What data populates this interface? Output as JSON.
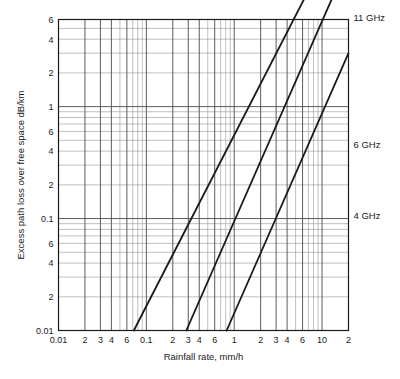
{
  "chart_data": {
    "type": "line",
    "title": "",
    "xlabel": "Rainfall rate, mm/h",
    "ylabel": "Excess path loss over free space dB/km",
    "xscale": "log",
    "yscale": "log",
    "xlim": [
      0.01,
      20
    ],
    "ylim": [
      0.01,
      6
    ],
    "grid": true,
    "legend_position": "right-of-axes-inline",
    "x_tick_labels": [
      {
        "value": 0.01,
        "label": "0.01"
      },
      {
        "value": 0.02,
        "label": "2"
      },
      {
        "value": 0.03,
        "label": "3"
      },
      {
        "value": 0.04,
        "label": "4"
      },
      {
        "value": 0.06,
        "label": "6"
      },
      {
        "value": 0.1,
        "label": "0.1"
      },
      {
        "value": 0.2,
        "label": "2"
      },
      {
        "value": 0.3,
        "label": "3"
      },
      {
        "value": 0.4,
        "label": "4"
      },
      {
        "value": 0.6,
        "label": "6"
      },
      {
        "value": 1,
        "label": "1"
      },
      {
        "value": 2,
        "label": "2"
      },
      {
        "value": 3,
        "label": "3"
      },
      {
        "value": 4,
        "label": "4"
      },
      {
        "value": 6,
        "label": "6"
      },
      {
        "value": 10,
        "label": "10"
      },
      {
        "value": 20,
        "label": "2"
      }
    ],
    "y_tick_labels": [
      {
        "value": 0.01,
        "label": "0.01"
      },
      {
        "value": 0.02,
        "label": "2"
      },
      {
        "value": 0.04,
        "label": "4"
      },
      {
        "value": 0.06,
        "label": "6"
      },
      {
        "value": 0.1,
        "label": "0.1"
      },
      {
        "value": 0.2,
        "label": "2"
      },
      {
        "value": 0.4,
        "label": "4"
      },
      {
        "value": 0.6,
        "label": "6"
      },
      {
        "value": 1,
        "label": "1"
      },
      {
        "value": 2,
        "label": "2"
      },
      {
        "value": 4,
        "label": "4"
      },
      {
        "value": 6,
        "label": "6"
      },
      {
        "value": 10,
        "label": "10"
      },
      {
        "value": 20,
        "label": "2"
      },
      {
        "value": 40,
        "label": "4"
      },
      {
        "value": 60,
        "label": "6"
      }
    ],
    "series": [
      {
        "name": "11 GHz",
        "label": "11 GHz",
        "color": "#1a1a1a",
        "points": [
          [
            0.072,
            0.01
          ],
          [
            20.0,
            54.0
          ]
        ]
      },
      {
        "name": "6 GHz",
        "label": "6 GHz",
        "color": "#1a1a1a",
        "points": [
          [
            0.285,
            0.01
          ],
          [
            20.0,
            20.0
          ]
        ]
      },
      {
        "name": "4 GHz",
        "label": "4 GHz",
        "color": "#1a1a1a",
        "points": [
          [
            0.82,
            0.01
          ],
          [
            20.0,
            3.0
          ]
        ]
      }
    ]
  },
  "colors": {
    "axis": "#1a1a1a",
    "grid_major": "#4a4a4a",
    "grid_minor": "#8c8c8c",
    "background": "#ffffff",
    "text": "#1a1a1a"
  }
}
